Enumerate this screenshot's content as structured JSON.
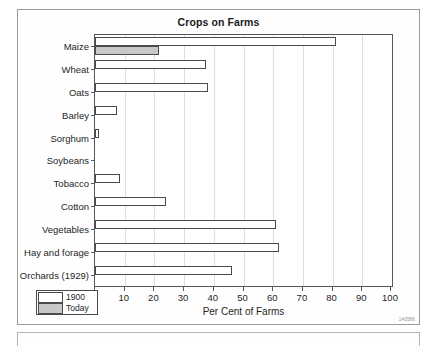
{
  "figure": {
    "code": "140586"
  },
  "chart_data": {
    "type": "bar",
    "orientation": "horizontal",
    "title": "Crops on Farms",
    "xlabel": "Per Cent of Farms",
    "ylabel": "",
    "xlim": [
      0,
      100
    ],
    "xticks": [
      0,
      10,
      20,
      30,
      40,
      50,
      60,
      70,
      80,
      90,
      100
    ],
    "grid": "vertical",
    "legend_position": "bottom-left",
    "categories": [
      "Maize",
      "Wheat",
      "Oats",
      "Barley",
      "Sorghum",
      "Soybeans",
      "Tobacco",
      "Cotton",
      "Vegetables",
      "Hay and forage",
      "Orchards (1929)"
    ],
    "series": [
      {
        "name": "1900",
        "color": "#ffffff",
        "values": [
          81,
          37.5,
          38,
          7.5,
          1.5,
          0,
          8.5,
          24,
          61,
          62,
          46
        ]
      },
      {
        "name": "Today",
        "color": "#c8c8c8",
        "values": [
          21.5,
          0,
          0,
          0,
          0,
          0,
          0,
          0,
          0,
          0,
          0
        ]
      }
    ]
  },
  "legend": {
    "items": [
      {
        "label": "1900",
        "swatch": "old"
      },
      {
        "label": "Today",
        "swatch": "today"
      }
    ]
  }
}
